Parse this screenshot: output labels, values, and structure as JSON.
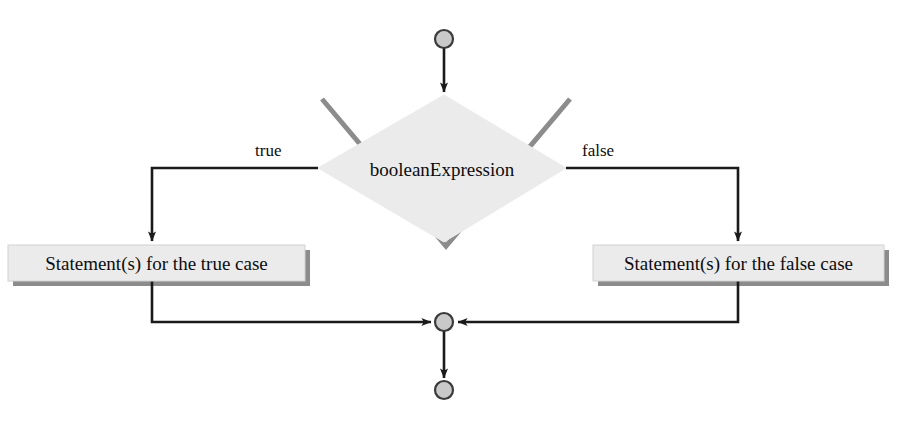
{
  "diagram": {
    "nodes": {
      "start_circle": "start-node",
      "decision": "booleanExpression",
      "true_branch_box": "Statement(s) for the true case",
      "false_branch_box": "Statement(s) for the false case",
      "merge_circle": "merge-node",
      "end_circle": "end-node"
    },
    "edge_labels": {
      "true": "true",
      "false": "false"
    },
    "colors": {
      "shape_fill": "#ebebeb",
      "shape_shadow": "#8c8c8c",
      "line": "#1a1a1a",
      "text": "#0d0d0d",
      "circle_fill": "#c9c9c9",
      "circle_stroke": "#3a3a3a",
      "background": "#ffffff"
    },
    "geometry": {
      "start_circle": {
        "cx": 444,
        "cy": 39,
        "r": 9
      },
      "merge_circle": {
        "cx": 444,
        "cy": 322,
        "r": 9
      },
      "end_circle": {
        "cx": 444,
        "cy": 390,
        "r": 9
      },
      "diamond": {
        "left": 318,
        "right": 566,
        "top": 95,
        "bottom": 242
      },
      "true_box": {
        "x": 8,
        "y": 245,
        "w": 297,
        "h": 36
      },
      "false_box": {
        "x": 593,
        "y": 245,
        "w": 291,
        "h": 36
      }
    }
  }
}
